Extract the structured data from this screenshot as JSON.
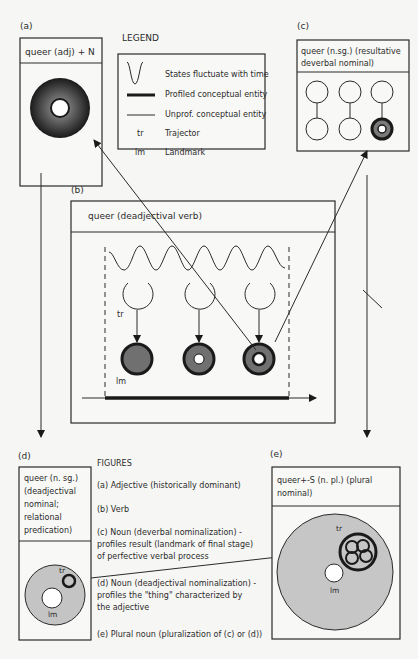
{
  "panels": {
    "a": {
      "tag": "(a)",
      "title": "queer (adj) + N"
    },
    "b": {
      "tag": "(b)",
      "title": "queer (deadjectival verb)",
      "tr_label": "tr",
      "lm_label": "lm"
    },
    "c": {
      "tag": "(c)",
      "title_line1": "queer (n.sg.) (resultative",
      "title_line2": "deverbal nominal)"
    },
    "d": {
      "tag": "(d)",
      "title_line1": "queer (n. sg.)",
      "title_line2": "(deadjectival",
      "title_line3": "nominal;",
      "title_line4": "relational",
      "title_line5": "predication)",
      "tr_label": "tr",
      "lm_label": "lm"
    },
    "e": {
      "tag": "(e)",
      "title_line1": "queer+-S (n. pl.) (plural",
      "title_line2": "nominal)",
      "tr_label": "tr",
      "lm_label": "lm"
    }
  },
  "legend": {
    "heading": "LEGEND",
    "items": [
      {
        "symbol": "wave-icon",
        "label": "States fluctuate with time"
      },
      {
        "symbol": "thick-line-icon",
        "label": "Profiled conceptual entity"
      },
      {
        "symbol": "thin-line-icon",
        "label": "Unprof. conceptual entity"
      },
      {
        "symbol": "tr",
        "label": "Trajector"
      },
      {
        "symbol": "lm",
        "label": "Landmark"
      }
    ]
  },
  "figures": {
    "heading": "FIGURES",
    "items": [
      {
        "lines": [
          "(a) Adjective (historically dominant)"
        ]
      },
      {
        "lines": [
          "(b) Verb"
        ]
      },
      {
        "lines": [
          "(c) Noun (deverbal nominalization) -",
          "profiles result (landmark of final stage)",
          "of perfective verbal process"
        ]
      },
      {
        "lines": [
          "(d) Noun (deadjectival nominalization) -",
          "profiles the \"thing\" characterized by",
          "the adjective"
        ]
      },
      {
        "lines": [
          "(e) Plural noun (pluralization of (c) or (d))"
        ]
      }
    ]
  },
  "colors": {
    "ink": "#2a2a2a",
    "landmark_gray": "#7a7a7a",
    "light_gray": "#c9c9c9",
    "background": "#f6f6f4"
  }
}
